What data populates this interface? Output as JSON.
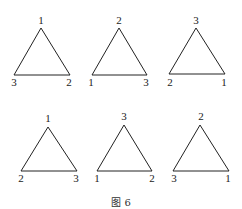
{
  "figure": {
    "caption": "图 6",
    "triangles": [
      {
        "top": "1",
        "bottom_left": "3",
        "bottom_right": "2"
      },
      {
        "top": "2",
        "bottom_left": "1",
        "bottom_right": "3"
      },
      {
        "top": "3",
        "bottom_left": "2",
        "bottom_right": "1"
      },
      {
        "top": "1",
        "bottom_left": "2",
        "bottom_right": "3"
      },
      {
        "top": "3",
        "bottom_left": "1",
        "bottom_right": "2"
      },
      {
        "top": "2",
        "bottom_left": "3",
        "bottom_right": "1"
      }
    ]
  },
  "colors": {
    "stroke": "#222222",
    "background": "#ffffff"
  }
}
